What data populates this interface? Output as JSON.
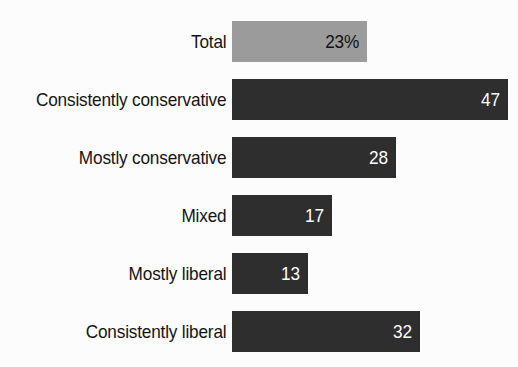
{
  "chart_data": {
    "type": "bar",
    "orientation": "horizontal",
    "title": "",
    "subtitle": "",
    "xlabel": "",
    "ylabel": "",
    "grid": false,
    "legend": false,
    "xlim": [
      0,
      50
    ],
    "categories": [
      "Total",
      "Consistently conservative",
      "Mostly conservative",
      "Mixed",
      "Mostly liberal",
      "Consistently liberal"
    ],
    "values": [
      23,
      47,
      28,
      17,
      13,
      32
    ],
    "value_labels": [
      "23%",
      "47",
      "28",
      "17",
      "13",
      "32"
    ],
    "bars": [
      {
        "label": "Total",
        "value": 23,
        "value_label": "23%",
        "style": "light",
        "bar_color": "#9b9b9b",
        "value_color": "#111111"
      },
      {
        "label": "Consistently conservative",
        "value": 47,
        "value_label": "47",
        "style": "dark",
        "bar_color": "#2e2e2e",
        "value_color": "#ffffff"
      },
      {
        "label": "Mostly conservative",
        "value": 28,
        "value_label": "28",
        "style": "dark",
        "bar_color": "#2e2e2e",
        "value_color": "#ffffff"
      },
      {
        "label": "Mixed",
        "value": 17,
        "value_label": "17",
        "style": "dark",
        "bar_color": "#2e2e2e",
        "value_color": "#ffffff"
      },
      {
        "label": "Mostly liberal",
        "value": 13,
        "value_label": "13",
        "style": "dark",
        "bar_color": "#2e2e2e",
        "value_color": "#ffffff"
      },
      {
        "label": "Consistently liberal",
        "value": 32,
        "value_label": "32",
        "style": "dark",
        "bar_color": "#2e2e2e",
        "value_color": "#ffffff"
      }
    ],
    "colors": {
      "background": "#fcfcfc",
      "bar_dark": "#2e2e2e",
      "bar_light": "#9b9b9b",
      "label_text": "#141414"
    }
  }
}
